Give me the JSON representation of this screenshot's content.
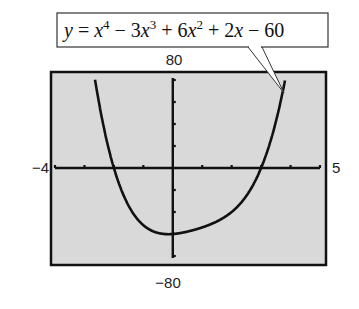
{
  "chart_data": {
    "type": "line",
    "title": "",
    "equation_label": "y = x⁴ − 3x³ + 6x² + 2x − 60",
    "equation_parts": {
      "lhs": "y",
      "eq": " = ",
      "t1": "x",
      "t1_exp": "4",
      "op1": " − 3",
      "t2": "x",
      "t2_exp": "3",
      "op2": " + 6",
      "t3": "x",
      "t3_exp": "2",
      "op3": " + 2",
      "t4": "x",
      "tail": " − 60"
    },
    "function": "x^4 - 3x^3 + 6x^2 + 2x - 60",
    "coefficients": [
      1,
      -3,
      6,
      2,
      -60
    ],
    "xlim": [
      -4,
      5
    ],
    "ylim": [
      -80,
      80
    ],
    "x_tick_step": 1,
    "y_tick_step": 20,
    "window_labels": {
      "xmin": "−4",
      "xmax": "5",
      "ymin": "−80",
      "ymax": "80"
    },
    "x_intercepts": [
      -2,
      3
    ],
    "y_intercept": -60,
    "grid": false,
    "background": "#d9d9d9",
    "line_color": "#111111",
    "xlabel": "",
    "ylabel": ""
  }
}
